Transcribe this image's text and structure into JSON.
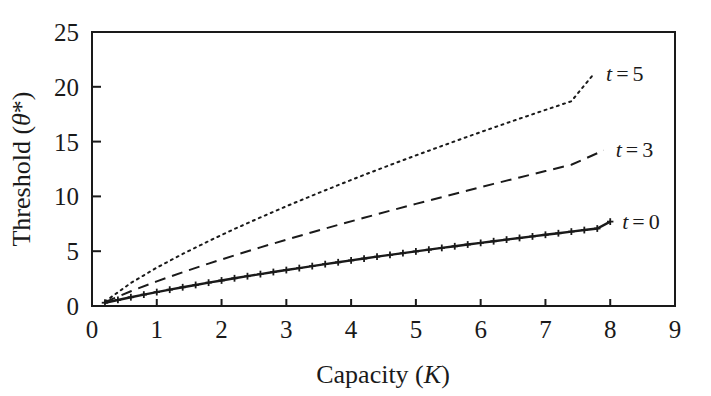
{
  "chart_data": {
    "type": "line",
    "title": "",
    "xlabel": "Capacity (K)",
    "xlabel_parts": {
      "text": "Capacity (",
      "italic": "K",
      "close": ")"
    },
    "ylabel": "Threshold (θ*)",
    "ylabel_parts": {
      "text": "Threshold (",
      "italic": "θ",
      "star": "*",
      "close": ")"
    },
    "xlim": [
      0,
      9
    ],
    "ylim": [
      0,
      25
    ],
    "xticks": [
      0,
      1,
      2,
      3,
      4,
      5,
      6,
      7,
      8,
      9
    ],
    "xtick_labels": [
      "0",
      "1",
      "2",
      "3",
      "4",
      "5",
      "6",
      "7",
      "8",
      "9"
    ],
    "yticks": [
      0,
      5,
      10,
      15,
      20,
      25
    ],
    "ytick_labels": [
      "0",
      "5",
      "10",
      "15",
      "20",
      "25"
    ],
    "grid": false,
    "legend_position": "right-inline",
    "frame": "full-box",
    "line_color": "#1a1a1a",
    "background_color": "#ffffff",
    "series": [
      {
        "name": "t = 0",
        "label_prefix": "t",
        "label_eq": "=",
        "label_value": "0",
        "style": "solid",
        "marker": "plus",
        "x": [
          0.2,
          0.4,
          0.6,
          0.8,
          1.0,
          1.2,
          1.4,
          1.6,
          1.8,
          2.0,
          2.2,
          2.4,
          2.6,
          2.8,
          3.0,
          3.2,
          3.4,
          3.6,
          3.8,
          4.0,
          4.2,
          4.4,
          4.6,
          4.8,
          5.0,
          5.2,
          5.4,
          5.6,
          5.8,
          6.0,
          6.2,
          6.4,
          6.6,
          6.8,
          7.0,
          7.2,
          7.4,
          7.6,
          7.8,
          8.0
        ],
        "values": [
          0.3,
          0.55,
          0.8,
          1.04,
          1.27,
          1.49,
          1.71,
          1.92,
          2.13,
          2.33,
          2.53,
          2.72,
          2.91,
          3.1,
          3.28,
          3.46,
          3.64,
          3.82,
          3.99,
          4.16,
          4.33,
          4.5,
          4.66,
          4.82,
          4.98,
          5.14,
          5.3,
          5.45,
          5.61,
          5.76,
          5.91,
          6.06,
          6.21,
          6.35,
          6.5,
          6.64,
          6.79,
          6.93,
          7.07,
          7.7
        ]
      },
      {
        "name": "t = 3",
        "label_prefix": "t",
        "label_eq": "=",
        "label_value": "3",
        "style": "dashed",
        "marker": "none",
        "x": [
          0.2,
          0.6,
          1.0,
          1.4,
          1.8,
          2.2,
          2.6,
          3.0,
          3.4,
          3.8,
          4.2,
          4.6,
          5.0,
          5.4,
          5.8,
          6.2,
          6.6,
          7.0,
          7.4,
          7.9
        ],
        "values": [
          0.35,
          1.35,
          2.25,
          3.08,
          3.87,
          4.62,
          5.35,
          6.05,
          6.73,
          7.4,
          8.05,
          8.69,
          9.32,
          9.93,
          10.54,
          11.14,
          11.73,
          12.31,
          12.89,
          14.2
        ]
      },
      {
        "name": "t = 5",
        "label_prefix": "t",
        "label_eq": "=",
        "label_value": "5",
        "style": "dotted",
        "marker": "none",
        "x": [
          0.2,
          0.6,
          1.0,
          1.4,
          1.8,
          2.2,
          2.6,
          3.0,
          3.4,
          3.8,
          4.2,
          4.6,
          5.0,
          5.4,
          5.8,
          6.2,
          6.6,
          7.0,
          7.4,
          7.75
        ],
        "values": [
          0.4,
          2.1,
          3.5,
          4.75,
          5.92,
          7.03,
          8.08,
          9.1,
          10.08,
          11.03,
          11.96,
          12.86,
          13.74,
          14.6,
          15.45,
          16.28,
          17.09,
          17.89,
          18.68,
          21.2
        ]
      }
    ]
  }
}
